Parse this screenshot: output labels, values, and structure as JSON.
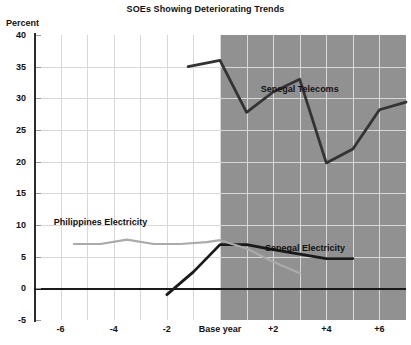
{
  "chart_data": {
    "type": "line",
    "title": "SOEs Showing Deteriorating Trends",
    "xlabel": "",
    "ylabel": "Percent",
    "ylim": [
      -5,
      40
    ],
    "xlim": [
      -7,
      7
    ],
    "grid": true,
    "legend_position": "inline-annotations",
    "yticks": [
      40,
      35,
      30,
      25,
      20,
      15,
      10,
      5,
      0,
      -5
    ],
    "xticks": [
      {
        "value": -6,
        "label": "-6"
      },
      {
        "value": -4,
        "label": "-4"
      },
      {
        "value": -2,
        "label": "-2"
      },
      {
        "value": 0,
        "label": "Base year"
      },
      {
        "value": 2,
        "label": "+2"
      },
      {
        "value": 4,
        "label": "+4"
      },
      {
        "value": 6,
        "label": "+6"
      }
    ],
    "shaded_region": {
      "from": 0,
      "to": 7,
      "color": "#919191",
      "label": "post base year"
    },
    "series": [
      {
        "name": "Senegal Telecoms",
        "color": "#333333",
        "label_x": 3.0,
        "label_y": 31.5,
        "x": [
          -1.2,
          0,
          1,
          2,
          3,
          4,
          5,
          6,
          7
        ],
        "values": [
          35.0,
          36.0,
          27.8,
          31.0,
          33.0,
          19.8,
          22.0,
          28.2,
          29.4
        ]
      },
      {
        "name": "Senegal Electricity",
        "color": "#1a1a1a",
        "label_x": 3.2,
        "label_y": 6.4,
        "x": [
          -2,
          -1,
          0,
          1,
          2,
          3,
          4,
          5
        ],
        "values": [
          -1.0,
          2.6,
          6.9,
          6.9,
          6.1,
          5.4,
          4.7,
          4.7
        ]
      },
      {
        "name": "Philippines Electricity",
        "color": "#aaaaaa",
        "label_x": -4.5,
        "label_y": 10.5,
        "x": [
          -5.5,
          -4.5,
          -3.5,
          -2.5,
          -1.5,
          -0.5,
          0,
          1,
          2,
          3
        ],
        "values": [
          7.0,
          7.0,
          7.7,
          7.0,
          7.0,
          7.3,
          7.6,
          6.3,
          4.2,
          2.4
        ]
      }
    ]
  }
}
